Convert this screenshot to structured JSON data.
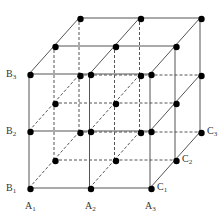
{
  "diagram": {
    "type": "3x3x3 lattice cube",
    "origin": [
      29,
      188
    ],
    "x_step": 60.5,
    "y_step": -57,
    "depth_step": [
      25,
      -28
    ],
    "grid_size": 3,
    "line_color": "#555555",
    "dot_color": "#000000",
    "labels": [
      {
        "id": "B3",
        "base": "B",
        "sub": "3",
        "x": 6,
        "y": 77
      },
      {
        "id": "B2",
        "base": "B",
        "sub": "2",
        "x": 6,
        "y": 134
      },
      {
        "id": "B1",
        "base": "B",
        "sub": "1",
        "x": 6,
        "y": 191
      },
      {
        "id": "A1",
        "base": "A",
        "sub": "1",
        "x": 25,
        "y": 209
      },
      {
        "id": "A2",
        "base": "A",
        "sub": "2",
        "x": 85,
        "y": 209
      },
      {
        "id": "A3",
        "base": "A",
        "sub": "3",
        "x": 145,
        "y": 209
      },
      {
        "id": "C1",
        "base": "C",
        "sub": "1",
        "x": 157,
        "y": 190
      },
      {
        "id": "C2",
        "base": "C",
        "sub": "2",
        "x": 182,
        "y": 162
      },
      {
        "id": "C3",
        "base": "C",
        "sub": "3",
        "x": 207,
        "y": 134
      }
    ]
  }
}
